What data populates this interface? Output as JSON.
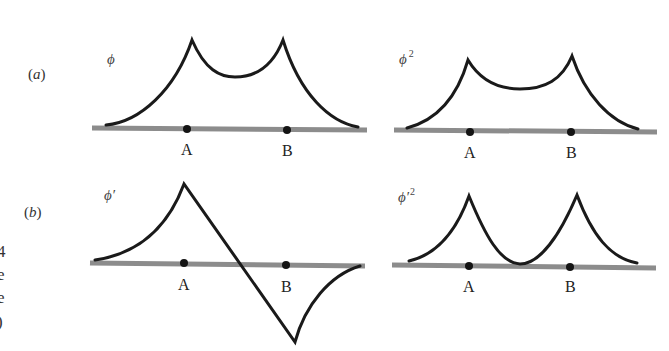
{
  "figure": {
    "rows": [
      {
        "label": "(a)",
        "label_letter": "a"
      },
      {
        "label": "(b)",
        "label_letter": "b"
      }
    ],
    "panels": [
      {
        "id": "a-left",
        "function_label": "ϕ",
        "superscript": "",
        "points": [
          "A",
          "B"
        ]
      },
      {
        "id": "a-right",
        "function_label": "ϕ",
        "superscript": "2",
        "points": [
          "A",
          "B"
        ]
      },
      {
        "id": "b-left",
        "function_label": "ϕ′",
        "superscript": "",
        "points": [
          "A",
          "B"
        ]
      },
      {
        "id": "b-right",
        "function_label": "ϕ′",
        "superscript": "2",
        "points": [
          "A",
          "B"
        ]
      }
    ],
    "margin_fragments": [
      "4",
      "e",
      "e",
      ")"
    ]
  },
  "colors": {
    "curve": "#1a1a1a",
    "axis": "#8c8c8c",
    "dot": "#141414"
  }
}
